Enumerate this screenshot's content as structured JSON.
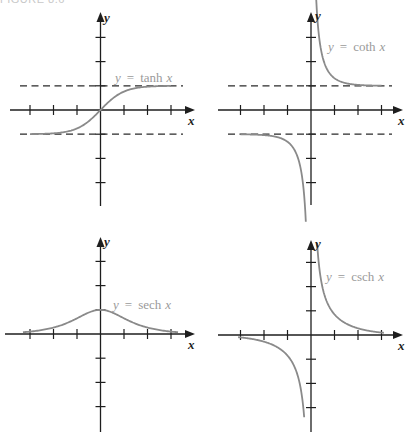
{
  "caption": "FIGURE 8.6",
  "chart_data": [
    {
      "type": "line",
      "title": "y = tanh x",
      "function": "tanh",
      "xlabel": "x",
      "ylabel": "y",
      "label_parts": {
        "lhs": "y",
        "eq": "=",
        "fn": "tanh",
        "var": "x"
      },
      "xlim": [
        -3,
        3
      ],
      "ylim": [
        -3,
        3
      ],
      "x_ticks": [
        -3,
        -2,
        -1,
        1,
        2,
        3
      ],
      "y_ticks": [
        -3,
        -2,
        -1,
        1,
        2,
        3
      ],
      "asymptotes": [
        {
          "type": "horizontal",
          "y": 1
        },
        {
          "type": "horizontal",
          "y": -1
        }
      ],
      "domain": [
        -3,
        3
      ],
      "x": [
        -3,
        -2,
        -1.5,
        -1,
        -0.5,
        0,
        0.5,
        1,
        1.5,
        2,
        3
      ],
      "y": [
        -0.995,
        -0.964,
        -0.905,
        -0.762,
        -0.462,
        0,
        0.462,
        0.762,
        0.905,
        0.964,
        0.995
      ],
      "grid": false
    },
    {
      "type": "line",
      "title": "y = coth x",
      "function": "coth",
      "xlabel": "x",
      "ylabel": "y",
      "label_parts": {
        "lhs": "y",
        "eq": "=",
        "fn": "coth",
        "var": "x"
      },
      "xlim": [
        -3,
        3
      ],
      "ylim": [
        -3,
        3
      ],
      "x_ticks": [
        -3,
        -2,
        -1,
        1,
        2,
        3
      ],
      "y_ticks": [
        -3,
        -2,
        -1,
        1,
        2,
        3
      ],
      "asymptotes": [
        {
          "type": "horizontal",
          "y": 1
        },
        {
          "type": "horizontal",
          "y": -1
        },
        {
          "type": "vertical",
          "x": 0
        }
      ],
      "branches": [
        {
          "domain": [
            0.2,
            3
          ],
          "x": [
            0.2,
            0.3,
            0.5,
            1,
            1.5,
            2,
            3
          ],
          "y": [
            5.07,
            3.43,
            2.16,
            1.31,
            1.1,
            1.04,
            1.005
          ]
        },
        {
          "domain": [
            -3,
            -0.22
          ],
          "x": [
            -3,
            -2,
            -1.5,
            -1,
            -0.5,
            -0.3,
            -0.22
          ],
          "y": [
            -1.005,
            -1.04,
            -1.1,
            -1.31,
            -2.16,
            -3.43,
            -4.7
          ]
        }
      ],
      "grid": false
    },
    {
      "type": "line",
      "title": "y = sech x",
      "function": "sech",
      "xlabel": "x",
      "ylabel": "y",
      "label_parts": {
        "lhs": "y",
        "eq": "=",
        "fn": "sech",
        "var": "x"
      },
      "xlim": [
        -3,
        3
      ],
      "ylim": [
        -3,
        3
      ],
      "x_ticks": [
        -3,
        -2,
        -1,
        1,
        2,
        3
      ],
      "y_ticks": [
        -3,
        -2,
        -1,
        1,
        2,
        3
      ],
      "asymptotes": [],
      "domain": [
        -3.3,
        3.3
      ],
      "x": [
        -3,
        -2,
        -1,
        0,
        1,
        2,
        3
      ],
      "y": [
        0.099,
        0.266,
        0.648,
        1,
        0.648,
        0.266,
        0.099
      ],
      "grid": false
    },
    {
      "type": "line",
      "title": "y = csch x",
      "function": "csch",
      "xlabel": "x",
      "ylabel": "y",
      "label_parts": {
        "lhs": "y",
        "eq": "=",
        "fn": "csch",
        "var": "x"
      },
      "xlim": [
        -3,
        3
      ],
      "ylim": [
        -3,
        3
      ],
      "x_ticks": [
        -3,
        -2,
        -1,
        1,
        2,
        3
      ],
      "y_ticks": [
        -3,
        -2,
        -1,
        1,
        2,
        3
      ],
      "asymptotes": [
        {
          "type": "vertical",
          "x": 0
        }
      ],
      "branches": [
        {
          "domain": [
            0.26,
            3.1
          ],
          "x": [
            0.26,
            0.5,
            1,
            1.5,
            2,
            3
          ],
          "y": [
            3.81,
            1.92,
            0.85,
            0.47,
            0.28,
            0.1
          ]
        },
        {
          "domain": [
            -3.1,
            -0.29
          ],
          "x": [
            -3,
            -2,
            -1.5,
            -1,
            -0.5,
            -0.29
          ],
          "y": [
            -0.1,
            -0.28,
            -0.47,
            -0.85,
            -1.92,
            -3.4
          ]
        }
      ],
      "grid": false
    }
  ],
  "colors": {
    "axis": "#1e1e1e",
    "curve": "#8a8a8a",
    "label": "#9a9a9a"
  }
}
